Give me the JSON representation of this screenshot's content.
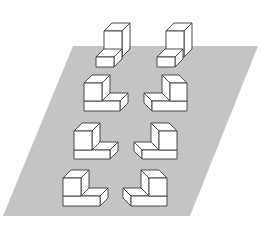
{
  "diagram": {
    "title": "",
    "canvas": {
      "width": 261,
      "height": 232,
      "background": "#ffffff"
    },
    "plane": {
      "name": "gray-parallelogram-plane",
      "color": "#c4c4c4",
      "corners": [
        [
          73,
          46
        ],
        [
          258,
          46
        ],
        [
          190,
          216
        ],
        [
          3,
          216
        ]
      ]
    },
    "depth_offset": {
      "dx": 8,
      "dy": -8
    },
    "blocks": [
      {
        "id": "r1-left",
        "row": 1,
        "side": "left",
        "shape": "step-block",
        "orientation": "tall-back",
        "cube": {
          "x": 104,
          "y": 31,
          "w": 18,
          "h": 19
        },
        "slab": {
          "x": 96,
          "y": 57,
          "w": 18,
          "h": 10
        }
      },
      {
        "id": "r1-right",
        "row": 1,
        "side": "right",
        "shape": "step-block",
        "orientation": "tall-back",
        "cube": {
          "x": 166,
          "y": 31,
          "w": 18,
          "h": 19
        },
        "slab": {
          "x": 157,
          "y": 57,
          "w": 18,
          "h": 10
        }
      },
      {
        "id": "r2-left",
        "row": 2,
        "side": "left",
        "shape": "l-block",
        "orientation": "cube-left",
        "cube": {
          "x": 84,
          "y": 83,
          "w": 18,
          "h": 18
        },
        "slab": {
          "x": 84,
          "y": 101,
          "w": 36,
          "h": 10
        }
      },
      {
        "id": "r2-right",
        "row": 2,
        "side": "right",
        "shape": "l-block",
        "orientation": "cube-right",
        "cube": {
          "x": 170,
          "y": 83,
          "w": 17,
          "h": 18
        },
        "slab": {
          "x": 152,
          "y": 101,
          "w": 35,
          "h": 10
        }
      },
      {
        "id": "r3-left",
        "row": 3,
        "side": "left",
        "shape": "l-block",
        "orientation": "cube-left",
        "cube": {
          "x": 74,
          "y": 131,
          "w": 18,
          "h": 19
        },
        "slab": {
          "x": 74,
          "y": 150,
          "w": 36,
          "h": 9
        }
      },
      {
        "id": "r3-right",
        "row": 3,
        "side": "right",
        "shape": "l-block",
        "orientation": "cube-right",
        "cube": {
          "x": 159,
          "y": 131,
          "w": 18,
          "h": 19
        },
        "slab": {
          "x": 142,
          "y": 150,
          "w": 35,
          "h": 9
        }
      },
      {
        "id": "r4-left",
        "row": 4,
        "side": "left",
        "shape": "l-block",
        "orientation": "cube-left",
        "cube": {
          "x": 63,
          "y": 178,
          "w": 18,
          "h": 18
        },
        "slab": {
          "x": 63,
          "y": 196,
          "w": 37,
          "h": 10
        }
      },
      {
        "id": "r4-right",
        "row": 4,
        "side": "right",
        "shape": "l-block",
        "orientation": "cube-right",
        "cube": {
          "x": 149,
          "y": 178,
          "w": 18,
          "h": 18
        },
        "slab": {
          "x": 131,
          "y": 196,
          "w": 36,
          "h": 10
        }
      }
    ],
    "colors": {
      "face_fill": "#ffffff",
      "edge_stroke": "#3a3a3a"
    }
  }
}
